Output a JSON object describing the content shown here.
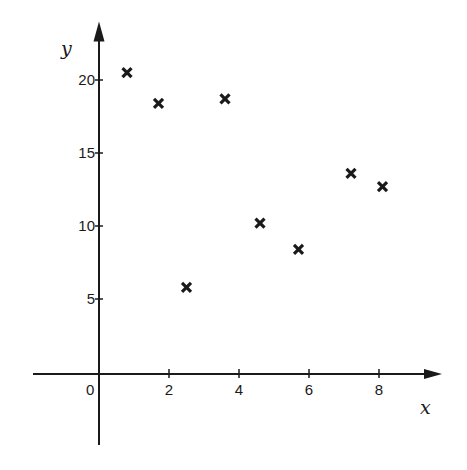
{
  "chart_data": {
    "type": "scatter",
    "title": "",
    "xlabel": "x",
    "ylabel": "y",
    "xlim": [
      -2,
      9.8
    ],
    "ylim": [
      -5,
      24
    ],
    "x_ticks": [
      2,
      4,
      6,
      8
    ],
    "x_tick_labels": [
      "2",
      "4",
      "6",
      "8"
    ],
    "y_ticks": [
      5,
      10,
      15,
      20
    ],
    "y_tick_labels": [
      "5",
      "10",
      "15",
      "20"
    ],
    "origin_label": "0",
    "grid": false,
    "legend": null,
    "marker": "x",
    "series": [
      {
        "name": "points",
        "points": [
          {
            "x": 0.8,
            "y": 20.5
          },
          {
            "x": 1.7,
            "y": 18.4
          },
          {
            "x": 2.5,
            "y": 5.8
          },
          {
            "x": 3.6,
            "y": 18.7
          },
          {
            "x": 4.6,
            "y": 10.2
          },
          {
            "x": 5.7,
            "y": 8.4
          },
          {
            "x": 7.2,
            "y": 13.6
          },
          {
            "x": 8.1,
            "y": 12.7
          }
        ]
      }
    ]
  }
}
